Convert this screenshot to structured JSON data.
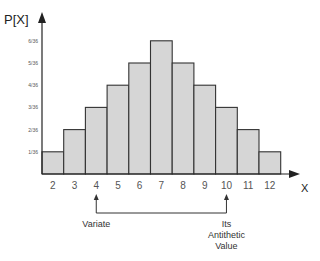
{
  "chart_data": {
    "type": "bar",
    "title": "",
    "xlabel": "X",
    "ylabel": "P[X]",
    "categories": [
      "2",
      "3",
      "4",
      "5",
      "6",
      "7",
      "8",
      "9",
      "10",
      "11",
      "12"
    ],
    "values": [
      1,
      2,
      3,
      4,
      5,
      6,
      5,
      4,
      3,
      2,
      1
    ],
    "value_unit": "1/36",
    "ylim": [
      0,
      6.6
    ],
    "yticks": [
      {
        "value": 1,
        "label": "1/36"
      },
      {
        "value": 2,
        "label": "2/36"
      },
      {
        "value": 3,
        "label": "3/36"
      },
      {
        "value": 4,
        "label": "4/36"
      },
      {
        "value": 5,
        "label": "5/36"
      },
      {
        "value": 6,
        "label": "6/36"
      }
    ],
    "grid": false,
    "bar_color": "#d6d6d6",
    "bar_edge_color": "#333333",
    "annotations": [
      {
        "x": "4",
        "text": [
          "Variate"
        ]
      },
      {
        "x": "10",
        "text": [
          "Its",
          "Antithetic",
          "Value"
        ]
      }
    ],
    "annotation_connector": {
      "from": "4",
      "to": "10"
    }
  }
}
